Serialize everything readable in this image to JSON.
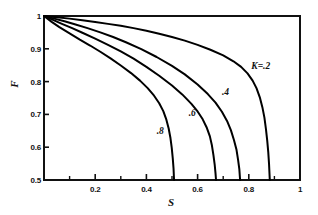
{
  "chart_data": {
    "type": "line",
    "title": "",
    "subtitle": "",
    "xlabel": "S",
    "ylabel": "F",
    "xlim": [
      0,
      1
    ],
    "ylim": [
      0.5,
      1
    ],
    "grid": false,
    "legend_position": "inline-annotations",
    "xticks": [
      0,
      0.2,
      0.4,
      0.6,
      0.8,
      1
    ],
    "xticklabels": [
      "",
      "0.2",
      "0.4",
      "0.6",
      "0.8",
      "1"
    ],
    "xminorticks": [
      0.1,
      0.3,
      0.5,
      0.7,
      0.9
    ],
    "yticks": [
      0.5,
      0.6,
      0.7,
      0.8,
      0.9,
      1
    ],
    "yticklabels": [
      "0.5",
      "0.6",
      "0.7",
      "0.8",
      "0.9",
      "1"
    ],
    "annotations": [
      {
        "text": "K=.2",
        "x": 0.81,
        "y": 0.845
      },
      {
        "text": ".4",
        "x": 0.695,
        "y": 0.765
      },
      {
        "text": ".6",
        "x": 0.565,
        "y": 0.7
      },
      {
        "text": ".8",
        "x": 0.44,
        "y": 0.645
      }
    ],
    "series": [
      {
        "name": "K=.2",
        "label": "K=.2",
        "color": "#000000",
        "points": [
          [
            0.0,
            1.0
          ],
          [
            0.05,
            0.996
          ],
          [
            0.1,
            0.992
          ],
          [
            0.15,
            0.987
          ],
          [
            0.2,
            0.982
          ],
          [
            0.25,
            0.976
          ],
          [
            0.3,
            0.97
          ],
          [
            0.35,
            0.963
          ],
          [
            0.4,
            0.955
          ],
          [
            0.45,
            0.946
          ],
          [
            0.5,
            0.936
          ],
          [
            0.55,
            0.925
          ],
          [
            0.6,
            0.912
          ],
          [
            0.65,
            0.897
          ],
          [
            0.7,
            0.88
          ],
          [
            0.74,
            0.862
          ],
          [
            0.77,
            0.845
          ],
          [
            0.795,
            0.825
          ],
          [
            0.815,
            0.803
          ],
          [
            0.83,
            0.78
          ],
          [
            0.843,
            0.752
          ],
          [
            0.853,
            0.722
          ],
          [
            0.861,
            0.69
          ],
          [
            0.867,
            0.655
          ],
          [
            0.872,
            0.62
          ],
          [
            0.876,
            0.585
          ],
          [
            0.879,
            0.55
          ],
          [
            0.882,
            0.5
          ]
        ]
      },
      {
        "name": "K=.4",
        "label": ".4",
        "color": "#000000",
        "points": [
          [
            0.0,
            1.0
          ],
          [
            0.04,
            0.992
          ],
          [
            0.08,
            0.984
          ],
          [
            0.12,
            0.975
          ],
          [
            0.17,
            0.963
          ],
          [
            0.22,
            0.95
          ],
          [
            0.27,
            0.936
          ],
          [
            0.32,
            0.92
          ],
          [
            0.38,
            0.899
          ],
          [
            0.44,
            0.875
          ],
          [
            0.5,
            0.848
          ],
          [
            0.55,
            0.822
          ],
          [
            0.6,
            0.791
          ],
          [
            0.64,
            0.762
          ],
          [
            0.67,
            0.736
          ],
          [
            0.695,
            0.708
          ],
          [
            0.715,
            0.68
          ],
          [
            0.73,
            0.652
          ],
          [
            0.742,
            0.622
          ],
          [
            0.752,
            0.592
          ],
          [
            0.758,
            0.562
          ],
          [
            0.763,
            0.533
          ],
          [
            0.766,
            0.5
          ]
        ]
      },
      {
        "name": "K=.6",
        "label": ".6",
        "color": "#000000",
        "points": [
          [
            0.0,
            1.0
          ],
          [
            0.035,
            0.988
          ],
          [
            0.07,
            0.976
          ],
          [
            0.11,
            0.963
          ],
          [
            0.15,
            0.949
          ],
          [
            0.2,
            0.931
          ],
          [
            0.25,
            0.912
          ],
          [
            0.3,
            0.892
          ],
          [
            0.35,
            0.87
          ],
          [
            0.4,
            0.845
          ],
          [
            0.45,
            0.818
          ],
          [
            0.5,
            0.788
          ],
          [
            0.54,
            0.761
          ],
          [
            0.575,
            0.733
          ],
          [
            0.6,
            0.709
          ],
          [
            0.62,
            0.685
          ],
          [
            0.635,
            0.661
          ],
          [
            0.648,
            0.633
          ],
          [
            0.656,
            0.605
          ],
          [
            0.662,
            0.575
          ],
          [
            0.667,
            0.545
          ],
          [
            0.67,
            0.52
          ],
          [
            0.672,
            0.5
          ]
        ]
      },
      {
        "name": "K=.8",
        "label": ".8",
        "color": "#000000",
        "points": [
          [
            0.0,
            1.0
          ],
          [
            0.03,
            0.982
          ],
          [
            0.06,
            0.966
          ],
          [
            0.1,
            0.947
          ],
          [
            0.14,
            0.928
          ],
          [
            0.18,
            0.91
          ],
          [
            0.22,
            0.891
          ],
          [
            0.26,
            0.871
          ],
          [
            0.3,
            0.849
          ],
          [
            0.34,
            0.826
          ],
          [
            0.375,
            0.803
          ],
          [
            0.405,
            0.78
          ],
          [
            0.43,
            0.757
          ],
          [
            0.45,
            0.734
          ],
          [
            0.466,
            0.71
          ],
          [
            0.478,
            0.684
          ],
          [
            0.487,
            0.657
          ],
          [
            0.494,
            0.628
          ],
          [
            0.499,
            0.598
          ],
          [
            0.503,
            0.566
          ],
          [
            0.506,
            0.535
          ],
          [
            0.508,
            0.5
          ]
        ]
      }
    ]
  },
  "axes": {
    "x_title": "S",
    "y_title": "F"
  }
}
